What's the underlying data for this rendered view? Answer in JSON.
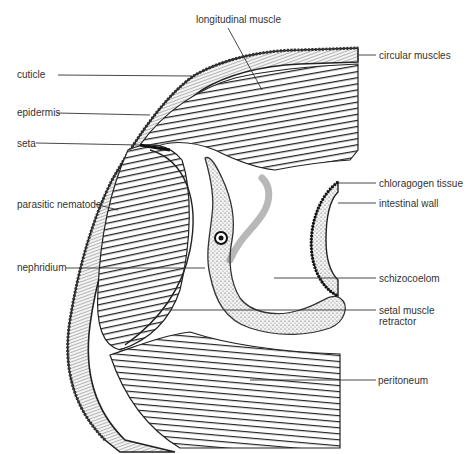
{
  "diagram": {
    "labels": {
      "longitudinal_muscle": "longitudinal muscle",
      "circular_muscles": "circular muscles",
      "cuticle": "cuticle",
      "epidermis": "epidermis",
      "seta": "seta",
      "chloragogen_tissue": "chloragogen  tissue",
      "intestinal_wall": "intestinal wall",
      "parasitic_nematode": "parasitic nematode",
      "nephridium": "nephridium",
      "schizocoelom": "schizocoelom",
      "setal_muscle_retractor_line1": "setal muscle",
      "setal_muscle_retractor_line2": "retractor",
      "peritoneum": "peritoneum"
    },
    "colors": {
      "ink": "#2a2a2a",
      "background": "#ffffff",
      "tissue_fill": "#e8e8e8"
    }
  }
}
